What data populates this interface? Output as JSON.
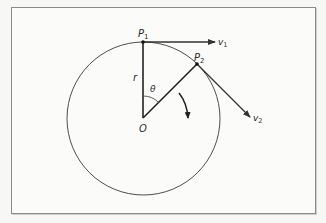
{
  "diagram": {
    "type": "circular-motion",
    "labels": {
      "p1": "P",
      "p1_sub": "1",
      "p2": "P",
      "p2_sub": "2",
      "v1": "v",
      "v1_sub": "1",
      "v2": "v",
      "v2_sub": "2",
      "radius": "r",
      "angle": "θ",
      "origin": "O"
    },
    "geometry": {
      "center": [
        143,
        118
      ],
      "radius": 76,
      "p1": [
        143,
        42
      ],
      "p2": [
        197,
        64
      ],
      "v1_tip": [
        215,
        42
      ],
      "v2_tip": [
        250,
        116
      ]
    },
    "colors": {
      "line": "#2a2a2a",
      "circle": "#3a3a3a",
      "border": "#8a8a8a",
      "background": "#fbfbfa"
    }
  }
}
